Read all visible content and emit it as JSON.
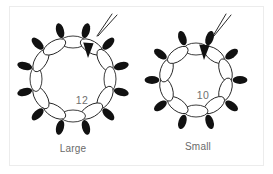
{
  "figure": {
    "background_color": "#ffffff",
    "border_color": "#ececec",
    "stroke_color": "#1a1a1a",
    "fill_color": "#111111",
    "text_color": "#6a6a6a"
  },
  "chart_data": {
    "type": "diagram",
    "title": "",
    "subtitle": "",
    "xlabel": "",
    "ylabel": "",
    "categories": [
      "Large",
      "Small"
    ],
    "values": [
      12,
      10
    ],
    "series": [
      {
        "name": "subunit count",
        "values": [
          12,
          10
        ]
      }
    ],
    "annotations": [
      "leader line to outer solid ellipse",
      "arrowhead to inner open ellipse"
    ],
    "legend_position": "none",
    "grid": false
  },
  "diagrams": [
    {
      "id": "large-ring",
      "caption": "Large",
      "count_label": "12",
      "subunits": 12,
      "center_x": 73,
      "center_y": 79,
      "ring_radius": 37,
      "open_ellipse_rx": 12.5,
      "open_ellipse_ry": 6.0,
      "solid_ellipse_radius": 50,
      "solid_ellipse_rx": 7.6,
      "solid_ellipse_ry": 3.9,
      "count_x": 82,
      "count_y": 104,
      "caption_x": 73,
      "caption_y": 152,
      "leader": {
        "line_a": [
          112,
          14,
          97,
          36
        ],
        "line_b": [
          117,
          15,
          98,
          36
        ]
      },
      "arrow": {
        "points": "88,58 83.2,42.5 93.6,43.2",
        "tip_x": 88,
        "tip_y": 58
      }
    },
    {
      "id": "small-ring",
      "caption": "Small",
      "count_label": "10",
      "subunits": 10,
      "center_x": 196,
      "center_y": 80,
      "ring_radius": 31,
      "open_ellipse_rx": 12.0,
      "open_ellipse_ry": 6.0,
      "solid_ellipse_radius": 44,
      "solid_ellipse_rx": 7.4,
      "solid_ellipse_ry": 3.9,
      "count_x": 203,
      "count_y": 99,
      "caption_x": 198,
      "caption_y": 150,
      "leader": {
        "line_a": [
          226,
          14,
          213,
          36
        ],
        "line_b": [
          231,
          15,
          214,
          36
        ]
      },
      "arrow": {
        "points": "204,60 199.2,44.5 209.6,45.2",
        "tip_x": 204,
        "tip_y": 60
      }
    }
  ]
}
